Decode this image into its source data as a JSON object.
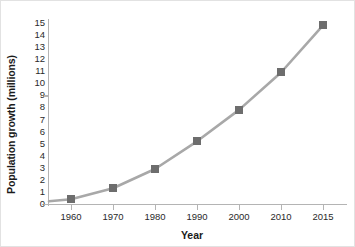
{
  "chart_data": {
    "type": "line",
    "title": "",
    "xlabel": "Year",
    "ylabel": "Population growth (millions)",
    "categories": [
      "1960",
      "1970",
      "1980",
      "1990",
      "2000",
      "2010",
      "2015"
    ],
    "x": [
      1960,
      1970,
      1980,
      1990,
      2000,
      2010,
      2015
    ],
    "values": [
      0.4,
      1.3,
      2.9,
      5.2,
      7.8,
      10.9,
      14.8
    ],
    "series": [
      {
        "name": "Population growth",
        "values": [
          0.4,
          1.3,
          2.9,
          5.2,
          7.8,
          10.9,
          14.8
        ]
      }
    ],
    "ylim": [
      0,
      15
    ],
    "yticks": [
      0,
      1,
      2,
      3,
      4,
      5,
      6,
      7,
      8,
      9,
      10,
      11,
      12,
      13,
      14,
      15
    ],
    "ytick_labels": [
      "0",
      "1",
      "2",
      "3",
      "4",
      "5",
      "6",
      "7",
      "8",
      "9",
      "10",
      "11",
      "12",
      "13",
      "14",
      "15"
    ],
    "grid": false,
    "legend": null,
    "marker": "square",
    "colors": {
      "line": "#a8a8a8",
      "marker": "#6d6d6d",
      "axis": "#b4b4b4",
      "text": "#1b1b1b"
    }
  }
}
